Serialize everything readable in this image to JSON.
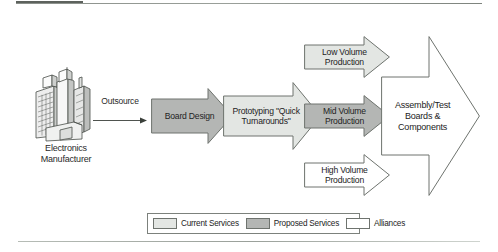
{
  "diagram": {
    "source_entity": {
      "icon": "factory-buildings-icon",
      "label_line1": "Electronics",
      "label_line2": "Manufacturer"
    },
    "connector": {
      "label": "Outsource",
      "icon": "right-arrow-icon"
    },
    "nodes": [
      {
        "id": "board-design",
        "label": "Board Design",
        "category": "Proposed Services",
        "fill": "#b4b6b4",
        "stroke": "#6e736e"
      },
      {
        "id": "prototyping",
        "label_line1": "Prototyping \"Quick",
        "label_line2": "Turnarounds\"",
        "category": "Current Services",
        "fill": "#e3e6e3",
        "stroke": "#6e736e"
      },
      {
        "id": "low-volume",
        "label_line1": "Low Volume",
        "label_line2": "Production",
        "category": "Current Services",
        "fill": "#e3e6e3",
        "stroke": "#6e736e"
      },
      {
        "id": "mid-volume",
        "label_line1": "Mid Volume",
        "label_line2": "Production",
        "category": "Proposed Services",
        "fill": "#b4b6b4",
        "stroke": "#6e736e"
      },
      {
        "id": "high-volume",
        "label_line1": "High Volume",
        "label_line2": "Production",
        "category": "Alliances",
        "fill": "#ffffff",
        "stroke": "#6e736e"
      },
      {
        "id": "assembly-test",
        "label_line1": "Assembly/Test",
        "label_line2": "Boards & Components",
        "category": "Alliances",
        "fill": "#ffffff",
        "stroke": "#6e736e"
      }
    ],
    "legend": {
      "items": [
        {
          "label": "Current Services",
          "color": "#e3e6e3"
        },
        {
          "label": "Proposed Services",
          "color": "#b4b6b4"
        },
        {
          "label": "Alliances",
          "color": "#ffffff"
        }
      ]
    }
  }
}
